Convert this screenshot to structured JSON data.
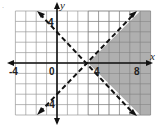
{
  "chart_data": {
    "type": "line",
    "title": "",
    "xlabel": "x",
    "ylabel": "y",
    "xlim": [
      -4,
      9
    ],
    "ylim": [
      -5,
      5
    ],
    "grid": true,
    "x_tick_labels": [
      "-4",
      "0",
      "4",
      "8"
    ],
    "y_tick_labels": [
      "4",
      "-4"
    ],
    "series": [
      {
        "name": "y = -x + 3",
        "style": "dashed",
        "points": [
          [
            -2,
            5
          ],
          [
            3,
            0
          ],
          [
            8,
            -5
          ]
        ]
      },
      {
        "name": "y = x - 3",
        "style": "dashed",
        "points": [
          [
            -2,
            -5
          ],
          [
            3,
            0
          ],
          [
            8,
            5
          ]
        ]
      }
    ],
    "intersection": [
      3,
      0
    ],
    "shaded_region": {
      "description": "y < x - 3 and y > -x + 3 (right of intersection)",
      "vertices": [
        [
          3,
          0
        ],
        [
          8,
          5
        ],
        [
          9,
          5
        ],
        [
          9,
          -5
        ],
        [
          8,
          -5
        ]
      ],
      "color": "#a6a6a6"
    }
  },
  "labels": {
    "x_axis": "x",
    "y_axis": "y",
    "tick_neg4": "-4",
    "tick_0": "0",
    "tick_4": "4",
    "tick_8": "8",
    "ytick_4": "4",
    "ytick_neg4": "-4"
  },
  "colors": {
    "shade": "#a6a6a6",
    "grid": "#9a9a9a",
    "axis": "#111111"
  }
}
